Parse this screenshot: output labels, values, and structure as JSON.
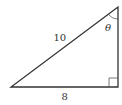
{
  "diagram": {
    "type": "right-triangle",
    "vertices": {
      "bottom_left": [
        11,
        87
      ],
      "bottom_right": [
        118,
        87
      ],
      "top": [
        118,
        7
      ]
    },
    "labels": {
      "hypotenuse": "10",
      "base": "8",
      "angle": "θ"
    },
    "right_angle_marker": "bottom-right",
    "angle_marker": "top",
    "stroke_color": "#333333"
  }
}
